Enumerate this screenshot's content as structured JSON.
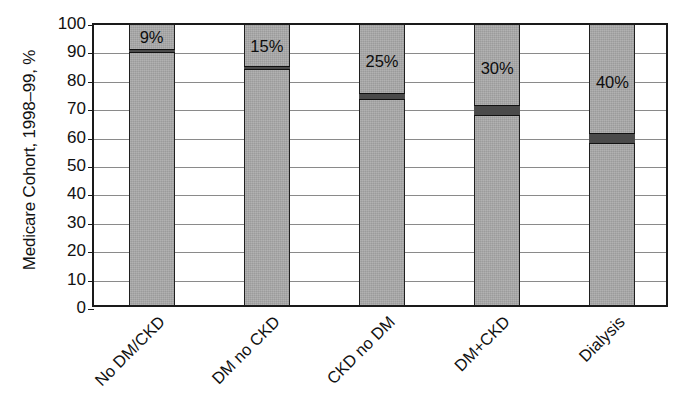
{
  "chart_data": {
    "type": "bar",
    "title": "",
    "subtitle": "",
    "xlabel": "",
    "ylabel": "Medicare Cohort, 1998–99, %",
    "ylim": [
      0,
      100
    ],
    "yticks": [
      0,
      10,
      20,
      30,
      40,
      50,
      60,
      70,
      80,
      90,
      100
    ],
    "ytick_labels": [
      "0",
      "10",
      "20",
      "30",
      "40",
      "50",
      "60",
      "70",
      "80",
      "90",
      "100"
    ],
    "grid": true,
    "legend": null,
    "legend_position": "none",
    "categories": [
      "No DM/CKD",
      "DM no CKD",
      "CKD no DM",
      "DM+CKD",
      "Dialysis"
    ],
    "values": [
      9,
      15,
      25,
      30,
      40
    ],
    "data_labels": [
      "9%",
      "15%",
      "25%",
      "30%",
      "40%"
    ],
    "segment_boundaries": [
      91,
      85,
      75,
      70,
      60
    ],
    "note": "Each bar spans the full 0-100 axis; a dark band marks the boundary, and the labeled percentage is the share above that band."
  },
  "axis": {
    "y_title": "Medicare Cohort, 1998–99, %",
    "y_ticks": [
      "100",
      "90",
      "80",
      "70",
      "60",
      "50",
      "40",
      "30",
      "20",
      "10",
      "0"
    ]
  },
  "bars": [
    {
      "category": "No DM/CKD",
      "label": "9%",
      "value": 9,
      "boundary": 91
    },
    {
      "category": "DM no CKD",
      "label": "15%",
      "value": 15,
      "boundary": 85
    },
    {
      "category": "CKD no DM",
      "label": "25%",
      "value": 25,
      "boundary": 75
    },
    {
      "category": "DM+CKD",
      "label": "30%",
      "value": 30,
      "boundary": 70
    },
    {
      "category": "Dialysis",
      "label": "40%",
      "value": 40,
      "boundary": 60
    }
  ],
  "colors": {
    "bar_fill": "#a9a9a9",
    "divider": "#4a4a4a",
    "frame": "#1a1a1a",
    "gridline": "#8a8a8a",
    "text": "#111111",
    "background": "#ffffff"
  }
}
